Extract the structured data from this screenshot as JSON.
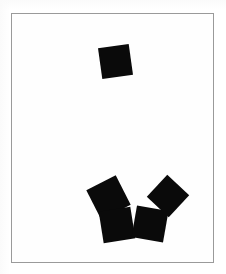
{
  "figure": {
    "title": "",
    "background_color": "#ffffff",
    "canvas": {
      "name": "white-card",
      "fill_color": "#fefefe",
      "border_color": "#9a9a9a",
      "border_width_px": 1,
      "x": 11,
      "y": 13,
      "width": 203,
      "height": 250
    },
    "shape_color": "#0a0a0a",
    "shape_count": 5,
    "groups": [
      {
        "name": "upper-single",
        "count": 1
      },
      {
        "name": "lower-cluster",
        "count": 4
      }
    ]
  },
  "shapes": [
    {
      "id": "square-1",
      "group": "upper-single",
      "label": "top square",
      "x": 88,
      "y": 32,
      "size": 31,
      "rotation_deg": -8,
      "color": "#0a0a0a"
    },
    {
      "id": "square-2",
      "group": "lower-cluster",
      "label": "cluster upper-left square",
      "x": 80,
      "y": 167,
      "size": 33,
      "rotation_deg": -27,
      "color": "#0a0a0a"
    },
    {
      "id": "square-3",
      "group": "lower-cluster",
      "label": "cluster lower-left square",
      "x": 89,
      "y": 195,
      "size": 32,
      "rotation_deg": -9,
      "color": "#0a0a0a"
    },
    {
      "id": "square-4",
      "group": "lower-cluster",
      "label": "cluster lower-right square",
      "x": 122,
      "y": 194,
      "size": 32,
      "rotation_deg": 10,
      "color": "#0a0a0a"
    },
    {
      "id": "square-5",
      "group": "lower-cluster",
      "label": "cluster upper-right square",
      "x": 141,
      "y": 167,
      "size": 30,
      "rotation_deg": 43,
      "color": "#0a0a0a"
    }
  ]
}
